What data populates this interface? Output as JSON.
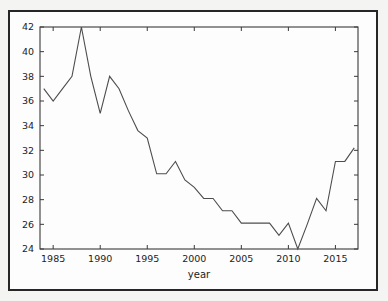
{
  "figure": {
    "background_color": "#f4f4f2",
    "frame_color": "#262626",
    "plot_background": "#fdfdfd"
  },
  "chart_data": {
    "type": "line",
    "title": "",
    "xlabel": "year",
    "ylabel": "",
    "xlim": [
      1983.6,
      2017.4
    ],
    "ylim": [
      24,
      42
    ],
    "grid": false,
    "legend": null,
    "line_color": "#4d4d4d",
    "x_ticks": [
      1985,
      1990,
      1995,
      2000,
      2005,
      2010,
      2015
    ],
    "x_tick_labels": [
      "1985",
      "1990",
      "1995",
      "2000",
      "2005",
      "2010",
      "2015"
    ],
    "y_ticks": [
      24,
      26,
      28,
      30,
      32,
      34,
      36,
      38,
      40,
      42
    ],
    "y_tick_labels": [
      "24",
      "26",
      "28",
      "30",
      "32",
      "34",
      "36",
      "38",
      "40",
      "42"
    ],
    "x": [
      1984,
      1985,
      1986,
      1987,
      1988,
      1989,
      1990,
      1991,
      1992,
      1993,
      1994,
      1995,
      1996,
      1997,
      1998,
      1999,
      2000,
      2001,
      2002,
      2003,
      2004,
      2005,
      2006,
      2007,
      2008,
      2009,
      2010,
      2011,
      2012,
      2013,
      2014,
      2015,
      2016,
      2017
    ],
    "values": [
      37.0,
      36.0,
      37.0,
      38.0,
      42.0,
      38.0,
      35.0,
      38.0,
      37.0,
      35.2,
      33.6,
      33.0,
      30.1,
      30.1,
      31.1,
      29.6,
      29.0,
      28.1,
      28.1,
      27.1,
      27.1,
      26.1,
      26.1,
      26.1,
      26.1,
      25.1,
      26.1,
      24.0,
      26.0,
      28.1,
      27.1,
      31.1,
      31.1,
      32.2
    ],
    "series": [
      {
        "name": "year series",
        "values": [
          37.0,
          36.0,
          37.0,
          38.0,
          42.0,
          38.0,
          35.0,
          38.0,
          37.0,
          35.2,
          33.6,
          33.0,
          30.1,
          30.1,
          31.1,
          29.6,
          29.0,
          28.1,
          28.1,
          27.1,
          27.1,
          26.1,
          26.1,
          26.1,
          26.1,
          25.1,
          26.1,
          24.0,
          26.0,
          28.1,
          27.1,
          31.1,
          31.1,
          32.2
        ]
      }
    ]
  }
}
